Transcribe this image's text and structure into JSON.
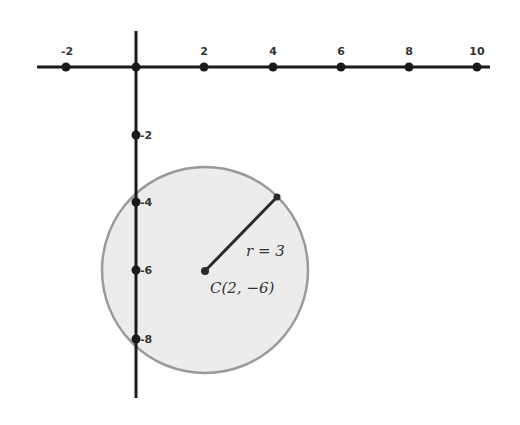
{
  "diagram": {
    "title": "",
    "colors": {
      "axis": "#1a1a1a",
      "circle_fill": "#ececec",
      "circle_stroke": "#9a9a9a",
      "radius": "#2a2a2a",
      "text": "#333333"
    },
    "x_axis": {
      "ticks": [
        {
          "value": -2,
          "label": "-2"
        },
        {
          "value": 2,
          "label": "2"
        },
        {
          "value": 4,
          "label": "4"
        },
        {
          "value": 6,
          "label": "6"
        },
        {
          "value": 8,
          "label": "8"
        },
        {
          "value": 10,
          "label": "10"
        }
      ],
      "range": [
        -2.9,
        10.3
      ]
    },
    "y_axis": {
      "ticks": [
        {
          "value": -2,
          "label": "-2"
        },
        {
          "value": -4,
          "label": "-4"
        },
        {
          "value": -6,
          "label": "-6"
        },
        {
          "value": -8,
          "label": "-8"
        }
      ],
      "range": [
        -9.7,
        1.0
      ]
    },
    "circle": {
      "center": {
        "x": 2,
        "y": -6
      },
      "radius": 3,
      "center_label": "C(2, −6)",
      "radius_label": "r = 3",
      "radius_endpoint": {
        "x": 4.1,
        "y": -3.9
      }
    }
  }
}
